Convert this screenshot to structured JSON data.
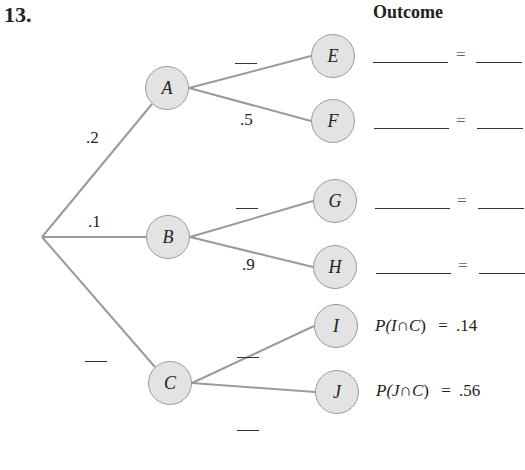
{
  "problem_number": "13.",
  "header": {
    "outcome_title": "Outcome"
  },
  "root": {
    "x": 42,
    "y": 237
  },
  "first_level": [
    {
      "id": "A",
      "label": "A",
      "x": 167,
      "y": 88,
      "branch_prob": ".2",
      "children": [
        "E",
        "F"
      ]
    },
    {
      "id": "B",
      "label": "B",
      "x": 168,
      "y": 237,
      "branch_prob": ".1",
      "children": [
        "G",
        "H"
      ]
    },
    {
      "id": "C",
      "label": "C",
      "x": 170,
      "y": 383,
      "branch_prob": "—",
      "children": [
        "I",
        "J"
      ]
    }
  ],
  "second_level": [
    {
      "id": "E",
      "label": "E",
      "x": 333,
      "y": 56,
      "parent": "A",
      "branch_prob": "—"
    },
    {
      "id": "F",
      "label": "F",
      "x": 333,
      "y": 121,
      "parent": "A",
      "branch_prob": ".5"
    },
    {
      "id": "G",
      "label": "G",
      "x": 335,
      "y": 201,
      "parent": "B",
      "branch_prob": "—"
    },
    {
      "id": "H",
      "label": "H",
      "x": 335,
      "y": 267,
      "parent": "B",
      "branch_prob": ".9"
    },
    {
      "id": "I",
      "label": "I",
      "x": 336,
      "y": 326,
      "parent": "C",
      "branch_prob": "—"
    },
    {
      "id": "J",
      "label": "J",
      "x": 337,
      "y": 392,
      "parent": "C",
      "branch_prob": "—"
    }
  ],
  "branch_labels": {
    "root_A": ".2",
    "root_B": ".1",
    "root_C": "—",
    "A_E": "—",
    "A_F": ".5",
    "B_G": "—",
    "B_H": ".9",
    "C_I": "—",
    "C_J": "—"
  },
  "outcomes": [
    {
      "node": "E",
      "expression": "",
      "equals": "=",
      "value": ""
    },
    {
      "node": "F",
      "expression": "",
      "equals": "=",
      "value": ""
    },
    {
      "node": "G",
      "expression": "",
      "equals": "=",
      "value": ""
    },
    {
      "node": "H",
      "expression": "",
      "equals": "=",
      "value": ""
    },
    {
      "node": "I",
      "prefix": "P(",
      "event": "I",
      "cap": "∩",
      "given": "C",
      "suffix": ")",
      "equals": "=",
      "value": ".14"
    },
    {
      "node": "J",
      "prefix": "P(",
      "event": "J",
      "cap": "∩",
      "given": "C",
      "suffix": ")",
      "equals": "=",
      "value": ".56"
    }
  ],
  "colors": {
    "node_fill": "#e3e3e3",
    "node_border": "#9a9a9a",
    "edge": "#9a9a9a",
    "text": "#222222"
  }
}
